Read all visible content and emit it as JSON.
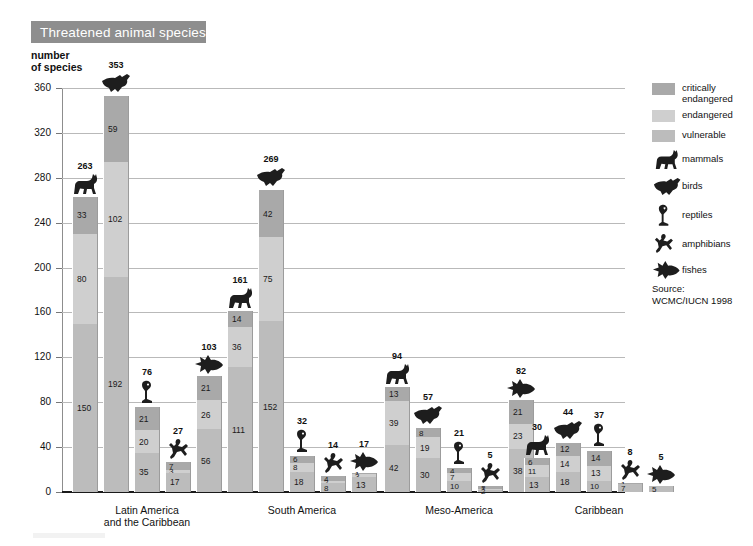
{
  "title": "Threatened animal species",
  "axis_caption": "number\nof species",
  "source": "Source:\nWCMC/IUCN 1998",
  "legend": {
    "swatches": [
      {
        "label": "critically\nendangered",
        "color": "#a9a9a9",
        "name": "critically-endangered"
      },
      {
        "label": "endangered",
        "color": "#cfcfcf",
        "name": "endangered"
      },
      {
        "label": "vulnerable",
        "color": "#bcbcbc",
        "name": "vulnerable"
      }
    ],
    "animals": [
      {
        "label": "mammals",
        "icon": "mammal-icon"
      },
      {
        "label": "birds",
        "icon": "bird-icon"
      },
      {
        "label": "reptiles",
        "icon": "reptile-icon"
      },
      {
        "label": "amphibians",
        "icon": "amphibian-icon"
      },
      {
        "label": "fishes",
        "icon": "fish-icon"
      }
    ]
  },
  "chart_data": {
    "type": "bar",
    "subtype": "stacked",
    "title": "Threatened animal species",
    "xlabel": "",
    "ylabel": "number of species",
    "ylim": [
      0,
      360
    ],
    "yticks": [
      0,
      40,
      80,
      120,
      160,
      200,
      240,
      280,
      320,
      360
    ],
    "grid": true,
    "legend_position": "right",
    "stack_order_bottom_to_top": [
      "vulnerable",
      "endangered",
      "critically endangered"
    ],
    "series": [
      {
        "name": "critically endangered",
        "color": "#a9a9a9"
      },
      {
        "name": "endangered",
        "color": "#cfcfcf"
      },
      {
        "name": "vulnerable",
        "color": "#bcbcbc"
      }
    ],
    "categories": [
      "Latin America and the Caribbean",
      "South America",
      "Meso-America",
      "Caribbean"
    ],
    "groups": [
      {
        "category": "Latin America\nand the Caribbean",
        "bars": [
          {
            "animal": "mammals",
            "icon": "mammal-icon",
            "total": 263,
            "critically_endangered": 33,
            "endangered": 80,
            "vulnerable": 150
          },
          {
            "animal": "birds",
            "icon": "bird-icon",
            "total": 353,
            "critically_endangered": 59,
            "endangered": 102,
            "vulnerable": 192
          },
          {
            "animal": "reptiles",
            "icon": "reptile-icon",
            "total": 76,
            "critically_endangered": 21,
            "endangered": 20,
            "vulnerable": 35
          },
          {
            "animal": "amphibians",
            "icon": "amphibian-icon",
            "total": 27,
            "critically_endangered": 7,
            "endangered": 3,
            "vulnerable": 17
          },
          {
            "animal": "fishes",
            "icon": "fish-icon",
            "total": 103,
            "critically_endangered": 21,
            "endangered": 26,
            "vulnerable": 56
          }
        ]
      },
      {
        "category": "South America",
        "bars": [
          {
            "animal": "mammals",
            "icon": "mammal-icon",
            "total": 161,
            "critically_endangered": 14,
            "endangered": 36,
            "vulnerable": 111
          },
          {
            "animal": "birds",
            "icon": "bird-icon",
            "total": 269,
            "critically_endangered": 42,
            "endangered": 75,
            "vulnerable": 152
          },
          {
            "animal": "reptiles",
            "icon": "reptile-icon",
            "total": 32,
            "critically_endangered": 6,
            "endangered": 8,
            "vulnerable": 18
          },
          {
            "animal": "amphibians",
            "icon": "amphibian-icon",
            "total": 14,
            "critically_endangered": 4,
            "endangered": 2,
            "vulnerable": 8
          },
          {
            "animal": "fishes",
            "icon": "fish-icon",
            "total": 17,
            "critically_endangered": 1,
            "endangered": 3,
            "vulnerable": 13
          }
        ]
      },
      {
        "category": "Meso-America",
        "bars": [
          {
            "animal": "mammals",
            "icon": "mammal-icon",
            "total": 94,
            "critically_endangered": 13,
            "endangered": 39,
            "vulnerable": 42
          },
          {
            "animal": "birds",
            "icon": "bird-icon",
            "total": 57,
            "critically_endangered": 8,
            "endangered": 19,
            "vulnerable": 30
          },
          {
            "animal": "reptiles",
            "icon": "reptile-icon",
            "total": 21,
            "critically_endangered": 4,
            "endangered": 7,
            "vulnerable": 10
          },
          {
            "animal": "amphibians",
            "icon": "amphibian-icon",
            "total": 5,
            "critically_endangered": 2,
            "endangered": 1,
            "vulnerable": 2
          },
          {
            "animal": "fishes",
            "icon": "fish-icon",
            "total": 82,
            "critically_endangered": 21,
            "endangered": 23,
            "vulnerable": 38
          }
        ]
      },
      {
        "category": "Caribbean",
        "bars": [
          {
            "animal": "mammals",
            "icon": "mammal-icon",
            "total": 30,
            "critically_endangered": 6,
            "endangered": 11,
            "vulnerable": 13
          },
          {
            "animal": "birds",
            "icon": "bird-icon",
            "total": 44,
            "critically_endangered": 12,
            "endangered": 14,
            "vulnerable": 18
          },
          {
            "animal": "reptiles",
            "icon": "reptile-icon",
            "total": 37,
            "critically_endangered": 14,
            "endangered": 13,
            "vulnerable": 10
          },
          {
            "animal": "amphibians",
            "icon": "amphibian-icon",
            "total": 8,
            "critically_endangered": 1,
            "endangered": 0,
            "vulnerable": 7
          },
          {
            "animal": "fishes",
            "icon": "fish-icon",
            "total": 5,
            "critically_endangered": 0,
            "endangered": 0,
            "vulnerable": 5
          }
        ]
      }
    ]
  }
}
